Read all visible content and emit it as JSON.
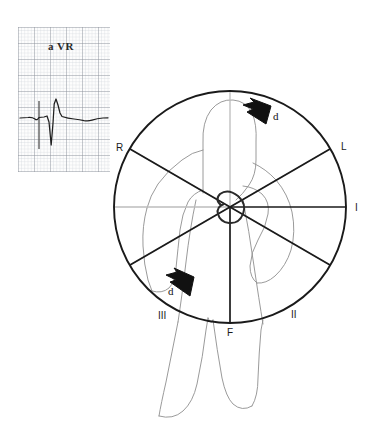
{
  "figure": {
    "background_color": "#ffffff"
  },
  "ecg_panel": {
    "lead_label": "a VR",
    "grid_minor_color": "#c8ccd4",
    "grid_major_color": "#8a8f99",
    "trace_color": "#1f1f1f",
    "calibration_mark": "square-calibration-pulse"
  },
  "hexaxial": {
    "circle_color": "#1a1a1a",
    "positive_axis_color": "#1a1a1a",
    "negative_axis_color": "#b7b7b7",
    "center_loop_color": "#2a2a2a",
    "labels": [
      {
        "id": "R",
        "text": "R",
        "angle_deg": -150,
        "x": 116,
        "y": 142
      },
      {
        "id": "L",
        "text": "L",
        "angle_deg": -30,
        "x": 341,
        "y": 141
      },
      {
        "id": "I",
        "text": "I",
        "angle_deg": 0,
        "x": 355,
        "y": 202
      },
      {
        "id": "II",
        "text": "II",
        "angle_deg": 60,
        "x": 291,
        "y": 309
      },
      {
        "id": "F",
        "text": "F",
        "angle_deg": 90,
        "x": 227,
        "y": 327
      },
      {
        "id": "III",
        "text": "III",
        "angle_deg": 120,
        "x": 158,
        "y": 310
      }
    ]
  },
  "vectors": [
    {
      "id": "d-upper",
      "text": "d",
      "x": 273,
      "y": 110
    },
    {
      "id": "d-lower",
      "text": "d",
      "x": 168,
      "y": 285
    }
  ],
  "body_outline": {
    "stroke_color": "#8e8e8e",
    "description": "human-torso-arms-legs-outline"
  }
}
